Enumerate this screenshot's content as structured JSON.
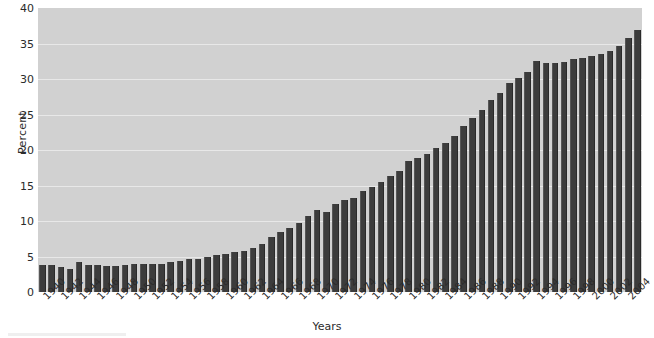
{
  "chart_data": {
    "type": "bar",
    "title": "",
    "subtitle": "",
    "xlabel": "Years",
    "ylabel": "Percent",
    "ylim": [
      0,
      40
    ],
    "yticks": [
      0,
      5,
      10,
      15,
      20,
      25,
      30,
      35,
      40
    ],
    "xtick_labels": [
      "1940",
      "1942",
      "1944",
      "1946",
      "1948",
      "1950",
      "1952",
      "1954",
      "1956",
      "1958",
      "1960",
      "1962",
      "1964",
      "1966",
      "1968",
      "1970",
      "1972",
      "1974",
      "1976",
      "1978",
      "1980",
      "1982",
      "1984",
      "1986",
      "1988",
      "1990",
      "1992",
      "1994",
      "1996",
      "1998",
      "2000",
      "2002",
      "2004"
    ],
    "xtick_step": 2,
    "grid": true,
    "legend": null,
    "legend_position": "none",
    "categories": [
      "1940",
      "1941",
      "1942",
      "1943",
      "1944",
      "1945",
      "1946",
      "1947",
      "1948",
      "1949",
      "1950",
      "1951",
      "1952",
      "1953",
      "1954",
      "1955",
      "1956",
      "1957",
      "1958",
      "1959",
      "1960",
      "1961",
      "1962",
      "1963",
      "1964",
      "1965",
      "1966",
      "1967",
      "1968",
      "1969",
      "1970",
      "1971",
      "1972",
      "1973",
      "1974",
      "1975",
      "1976",
      "1977",
      "1978",
      "1979",
      "1980",
      "1981",
      "1982",
      "1983",
      "1984",
      "1985",
      "1986",
      "1987",
      "1988",
      "1989",
      "1990",
      "1991",
      "1992",
      "1993",
      "1994",
      "1995",
      "1996",
      "1997",
      "1998",
      "1999",
      "2000",
      "2001",
      "2002",
      "2003",
      "2004",
      "2005"
    ],
    "values": [
      3.8,
      3.8,
      3.5,
      3.3,
      4.2,
      3.8,
      3.8,
      3.6,
      3.6,
      3.8,
      3.9,
      3.9,
      3.9,
      4.0,
      4.2,
      4.4,
      4.7,
      4.7,
      5.0,
      5.2,
      5.3,
      5.6,
      5.8,
      6.2,
      6.8,
      7.7,
      8.4,
      9.0,
      9.7,
      10.7,
      11.5,
      11.3,
      12.4,
      13.0,
      13.2,
      14.2,
      14.8,
      15.5,
      16.3,
      17.1,
      18.4,
      18.9,
      19.4,
      20.3,
      21.0,
      22.0,
      23.4,
      24.5,
      25.7,
      27.1,
      28.0,
      29.5,
      30.1,
      31.0,
      32.6,
      32.2,
      32.2,
      32.4,
      32.8,
      33.0,
      33.2,
      33.5,
      34.0,
      34.6,
      35.8,
      36.9
    ],
    "colors": {
      "bar": "#3c3c3c",
      "plot_background": "#d1d1d1",
      "gridline": "#ececec",
      "text": "#2b2b2b",
      "page_background": "#ffffff"
    }
  }
}
